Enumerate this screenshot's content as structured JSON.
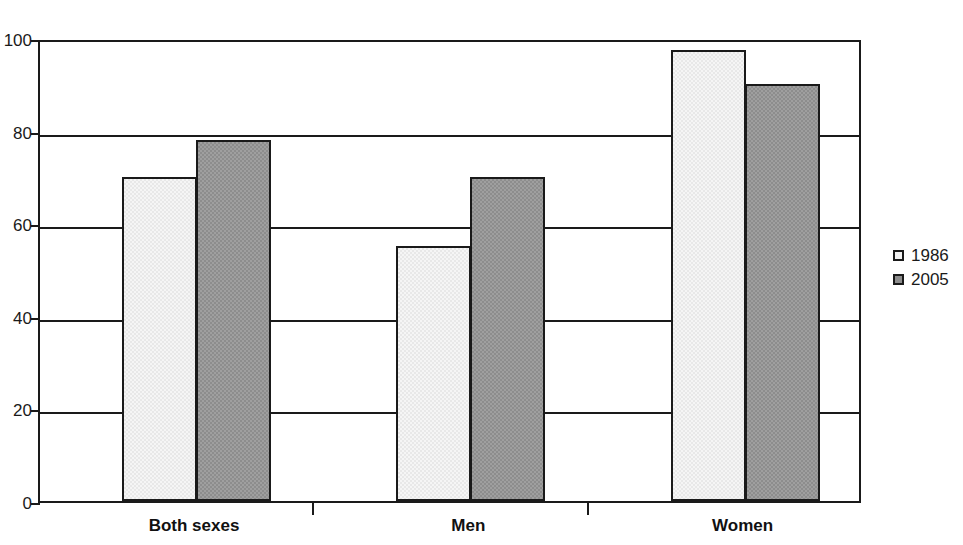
{
  "chart_data": {
    "type": "bar",
    "title": "",
    "subtitle": "",
    "xlabel": "",
    "ylabel": "",
    "categories": [
      "Both sexes",
      "Men",
      "Women"
    ],
    "series": [
      {
        "name": "1986",
        "values": [
          70,
          55,
          97.5
        ],
        "color": "#e8e8e8"
      },
      {
        "name": "2005",
        "values": [
          78,
          70,
          90
        ],
        "color": "#8d8d8d"
      }
    ],
    "ylim": [
      0,
      100
    ],
    "yticks": [
      0,
      20,
      40,
      60,
      80,
      100
    ],
    "ytick_labels": [
      "0",
      "20",
      "40",
      "60",
      "80",
      "100"
    ],
    "grid": true,
    "grid_axis": "y",
    "legend_position": "right"
  },
  "legend": {
    "entries": [
      {
        "label": "1986"
      },
      {
        "label": "2005"
      }
    ]
  },
  "axis": {
    "y_labels": [
      "100",
      "80",
      "60",
      "40",
      "20",
      "0"
    ]
  },
  "categories": {
    "labels": [
      "Both sexes",
      "Men",
      "Women"
    ]
  },
  "colors": {
    "series_1986": "#e8e8e8",
    "series_2005": "#8d8d8d",
    "axis": "#1a1a1a",
    "background": "#ffffff"
  }
}
